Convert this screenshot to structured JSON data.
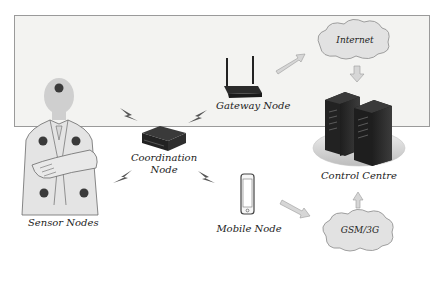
{
  "diagram": {
    "nodes": {
      "sensor": {
        "label": "Sensor Nodes"
      },
      "coordination": {
        "label_line1": "Coordination",
        "label_line2": "Node"
      },
      "gateway": {
        "label": "Gateway Node"
      },
      "mobile": {
        "label": "Mobile Node"
      },
      "internet": {
        "label": "Internet"
      },
      "gsm": {
        "label": "GSM/3G"
      },
      "control": {
        "label": "Control Centre"
      }
    },
    "edges": [
      {
        "from": "sensor",
        "to": "coordination",
        "type": "wireless"
      },
      {
        "from": "coordination",
        "to": "gateway",
        "type": "wireless"
      },
      {
        "from": "coordination",
        "to": "mobile",
        "type": "wireless"
      },
      {
        "from": "gateway",
        "to": "internet",
        "type": "arrow"
      },
      {
        "from": "internet",
        "to": "control",
        "type": "arrow"
      },
      {
        "from": "mobile",
        "to": "gsm",
        "type": "arrow"
      },
      {
        "from": "gsm",
        "to": "control",
        "type": "arrow"
      }
    ],
    "colors": {
      "panel_bg": "#f3f3f1",
      "panel_border": "#9a9a9a",
      "device_dark": "#2b2b2b",
      "arrow_fill": "#d6d6d6",
      "cloud_fill": "#e2e2e2",
      "sensor_dot": "#3a3a3a"
    }
  }
}
